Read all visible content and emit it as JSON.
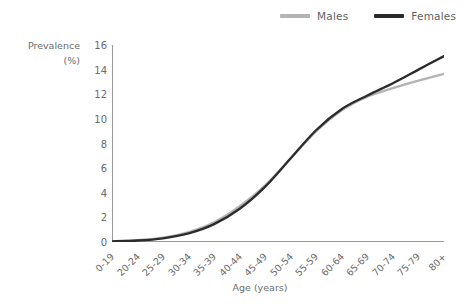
{
  "legend": {
    "position": "top-right",
    "entries": [
      {
        "label": "Males",
        "color": "#b4b4b4",
        "swatch_name": "legend-swatch-males"
      },
      {
        "label": "Females",
        "color": "#2b2b2b",
        "swatch_name": "legend-swatch-females"
      }
    ]
  },
  "axes": {
    "y_title_line1": "Prevalence",
    "y_title_line2": "(%)",
    "x_title": "Age (years)"
  },
  "chart_data": {
    "type": "line",
    "title": "",
    "subtitle": "",
    "xlabel": "Age (years)",
    "ylabel": "Prevalence (%)",
    "ylim": [
      0,
      16
    ],
    "yticks": [
      0,
      2,
      4,
      6,
      8,
      10,
      12,
      14,
      16
    ],
    "grid": false,
    "legend_position": "top-right",
    "categories": [
      "0-19",
      "20-24",
      "25-29",
      "30-34",
      "35-39",
      "40-44",
      "45-49",
      "50-54",
      "55-59",
      "60-64",
      "65-69",
      "70-74",
      "75-79",
      "80+"
    ],
    "series": [
      {
        "name": "Males",
        "color": "#b4b4b4",
        "values": [
          0.05,
          0.15,
          0.35,
          0.8,
          1.6,
          2.9,
          4.6,
          6.8,
          9.0,
          10.7,
          11.8,
          12.5,
          13.1,
          13.65
        ]
      },
      {
        "name": "Females",
        "color": "#2b2b2b",
        "values": [
          0.05,
          0.12,
          0.3,
          0.7,
          1.45,
          2.7,
          4.5,
          6.8,
          9.1,
          10.8,
          11.9,
          12.9,
          14.0,
          15.1
        ]
      }
    ]
  }
}
